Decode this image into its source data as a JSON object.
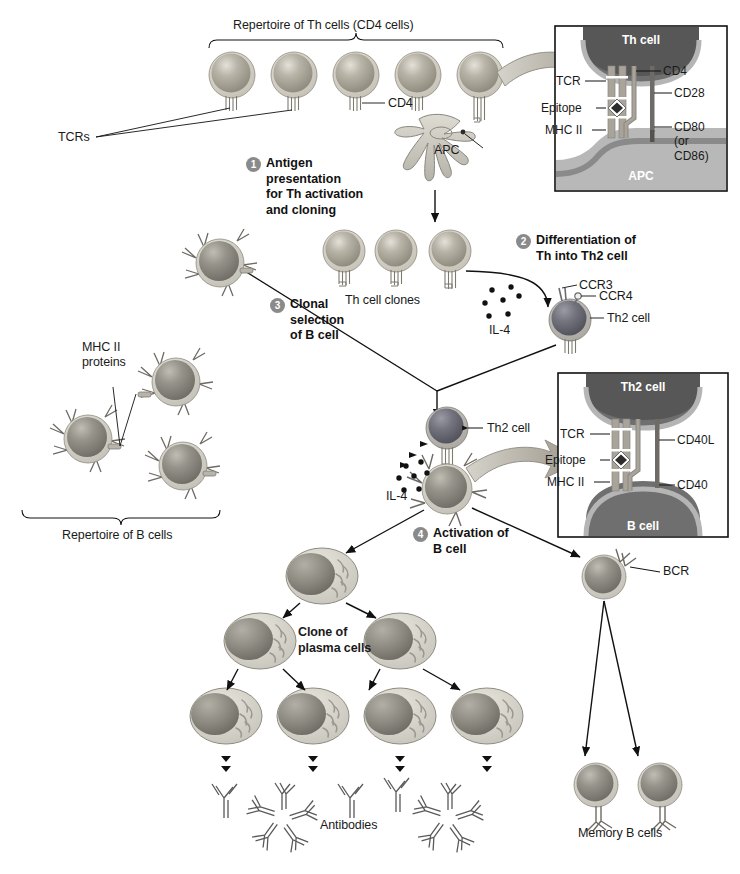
{
  "brackets": {
    "th_repertoire": "Repertoire of Th cells (CD4 cells)",
    "b_repertoire": "Repertoire of B cells"
  },
  "labels": {
    "tcrs": "TCRs",
    "cd4": "CD4",
    "apc": "APC",
    "th_clones": "Th cell clones",
    "il4_top": "IL-4",
    "il4_bottom": "IL-4",
    "ccr3": "CCR3",
    "ccr4": "CCR4",
    "th2_cell_right": "Th2 cell",
    "mhc2_proteins": "MHC II\nproteins",
    "th2_cell_center": "Th2 cell",
    "bcr": "BCR",
    "clone_plasma": "Clone of\nplasma cells",
    "antibodies": "Antibodies",
    "memory_b": "Memory B cells"
  },
  "steps": [
    {
      "num": "1",
      "text": "Antigen\npresentation\nfor Th activation\nand cloning"
    },
    {
      "num": "2",
      "text": "Differentiation of\nTh into Th2 cell"
    },
    {
      "num": "3",
      "text": "Clonal\nselection\nof B cell"
    },
    {
      "num": "4",
      "text": "Activation of\nB cell"
    }
  ],
  "inset_top": {
    "cell_top": "Th cell",
    "cell_bottom": "APC",
    "left_labels": [
      "TCR",
      "Epitope",
      "MHC II"
    ],
    "right_labels": [
      "CD4",
      "CD28",
      "CD80\n(or\nCD86)"
    ]
  },
  "inset_bottom": {
    "cell_top": "Th2 cell",
    "cell_bottom": "B cell",
    "left_labels": [
      "TCR",
      "Epitope",
      "MHC II"
    ],
    "right_labels": [
      "CD40L",
      "CD40"
    ]
  },
  "colors": {
    "th_cell_fill": "#a9a496",
    "th_cell_rim": "#cfcabd",
    "th2_cell_fill": "#6f6f78",
    "b_cell_fill": "#8f8f8f",
    "plasma_fill": "#c9c6bd",
    "line": "#111111",
    "badge": "#8a8a8a",
    "inset_border": "#1a1a1a",
    "membrane": "#9a9a9a",
    "receptor": "#b8b4aa",
    "arrow_fat": "#b0aca2"
  }
}
